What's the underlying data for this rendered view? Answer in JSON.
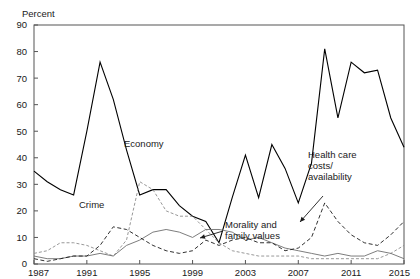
{
  "chart_data": {
    "type": "line",
    "title": "",
    "subtitle": "",
    "xlabel": "",
    "ylabel": "Percent",
    "ylim": [
      0,
      90
    ],
    "xlim": [
      1987,
      2015
    ],
    "ytick_labels": [
      "0",
      "10",
      "20",
      "30",
      "40",
      "50",
      "60",
      "70",
      "80",
      "90"
    ],
    "yticks": [
      0,
      10,
      20,
      30,
      40,
      50,
      60,
      70,
      80,
      90
    ],
    "xtick_labels": [
      "1987",
      "1991",
      "1995",
      "1999",
      "2003",
      "2007",
      "2011",
      "2015"
    ],
    "xticks": [
      1987,
      1991,
      1995,
      1999,
      2003,
      2007,
      2011,
      2015
    ],
    "grid": false,
    "legend_position": "inline-annotations",
    "x": [
      1987,
      1988,
      1989,
      1990,
      1991,
      1992,
      1993,
      1994,
      1995,
      1996,
      1997,
      1998,
      1999,
      2000,
      2001,
      2002,
      2003,
      2004,
      2005,
      2006,
      2007,
      2008,
      2009,
      2010,
      2011,
      2012,
      2013,
      2014,
      2015
    ],
    "series": [
      {
        "name": "Economy",
        "style": "solid",
        "color": "#000000",
        "width": 1.1,
        "values": [
          35,
          31,
          28,
          26,
          50,
          76,
          62,
          43,
          26,
          28,
          28,
          22,
          18,
          16,
          8,
          25,
          41,
          25,
          45,
          36,
          23,
          38,
          81,
          55,
          76,
          72,
          73,
          55,
          44
        ]
      },
      {
        "name": "Crime",
        "style": "dashed-light",
        "color": "#8c8c8c",
        "width": 0.9,
        "values": [
          4,
          5,
          8,
          8,
          7,
          5,
          3,
          9,
          31,
          28,
          20,
          18,
          18,
          13,
          8,
          5,
          4,
          3,
          3,
          3,
          3,
          2,
          2,
          2,
          2,
          2,
          2,
          4,
          7
        ]
      },
      {
        "name": "Morality and family values",
        "style": "solid-thin",
        "color": "#6e6e6e",
        "width": 0.9,
        "values": [
          3,
          2,
          2,
          3,
          3,
          4,
          3,
          7,
          9,
          12,
          13,
          12,
          10,
          13,
          13,
          12,
          9,
          10,
          8,
          6,
          5,
          4,
          3,
          4,
          3,
          3,
          5,
          4,
          2
        ]
      },
      {
        "name": "Health care costs/availability",
        "style": "dashed",
        "color": "#1a1a1a",
        "width": 0.9,
        "values": [
          2,
          1,
          2,
          3,
          3,
          7,
          14,
          13,
          10,
          7,
          5,
          4,
          5,
          9,
          7,
          9,
          10,
          8,
          8,
          5,
          6,
          10,
          23,
          16,
          11,
          8,
          7,
          11,
          16
        ]
      }
    ],
    "annotations": [
      {
        "id": "economy",
        "label_lines": [
          "Economy"
        ],
        "x_px": 124,
        "y_px": 147,
        "arrow": false
      },
      {
        "id": "crime",
        "label_lines": [
          "Crime"
        ],
        "x_px": 79,
        "y_px": 208,
        "arrow": false
      },
      {
        "id": "morality",
        "label_lines": [
          "Morality and",
          "family values"
        ],
        "x_px": 225,
        "y_px": 228,
        "arrow": true,
        "arrow_x1": 223,
        "arrow_y1": 231,
        "arrow_x2": 200,
        "arrow_y2": 238
      },
      {
        "id": "healthcare",
        "label_lines": [
          "Health care",
          "costs/",
          "availability"
        ],
        "x_px": 308,
        "y_px": 158,
        "arrow": true,
        "arrow_x1": 323,
        "arrow_y1": 196,
        "arrow_x2": 300,
        "arrow_y2": 222
      }
    ]
  },
  "plot": {
    "left_px": 34,
    "right_px": 404,
    "top_px": 25,
    "bottom_px": 264
  }
}
